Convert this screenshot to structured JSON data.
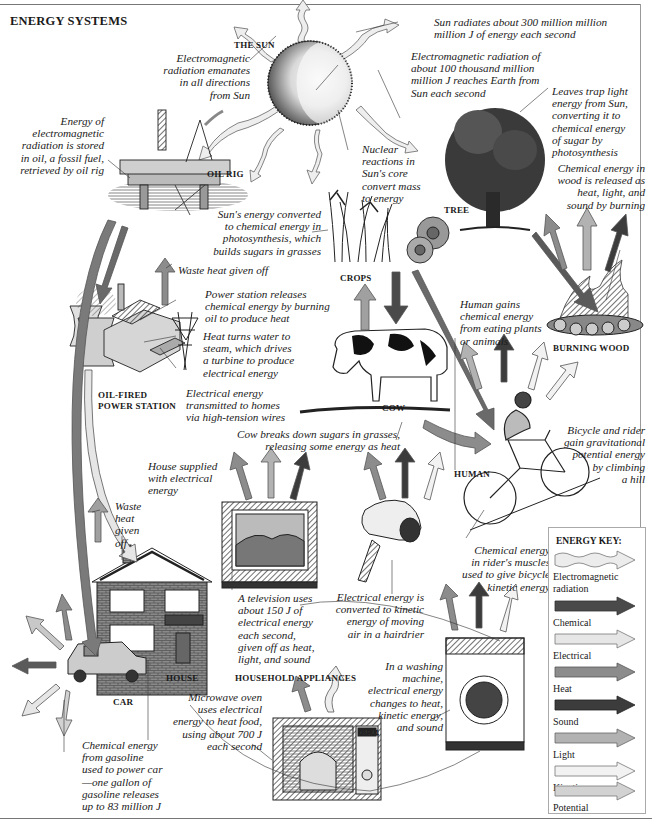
{
  "header": {
    "title": "ENERGY SYSTEMS"
  },
  "labels": {
    "sun": "THE SUN",
    "oil_rig": "OIL RIG",
    "tree": "TREE",
    "crops": "CROPS",
    "burning_wood": "BURNING WOOD",
    "power_station": "OIL-FIRED\nPOWER STATION",
    "power_station_line1": "OIL-FIRED",
    "power_station_line2": "POWER STATION",
    "cow": "COW",
    "human": "HUMAN",
    "house": "HOUSE",
    "household_appliances": "HOUSEHOLD APPLIANCES",
    "car": "CAR"
  },
  "annotations": {
    "em_emanates": "Electromagnetic\nradiation emanates\nin all directions\nfrom Sun",
    "sun_radiates": "Sun radiates about 300 million million\nmillion J of energy each second",
    "em_reaches_earth": "Electromagnetic radiation of\nabout 100 thousand million\nmillion J reaches Earth from\nSun each second",
    "leaves_trap": "Leaves trap light\nenergy from Sun,\nconverting it to\nchemical energy\nof sugar by\nphotosynthesis",
    "oil_stored": "Energy of\nelectromagnetic\nradiation is stored\nin oil, a fossil fuel,\nretrieved by oil rig",
    "nuclear": "Nuclear\nreactions in\nSun's core\nconvert mass\nto energy",
    "wood_released": "Chemical energy in\nwood is released as\nheat, light, and\nsound by burning",
    "photosynthesis_grasses": "Sun's energy converted\nto chemical energy in\nphotosynthesis, which\nbuilds sugars in grasses",
    "waste_heat_station": "Waste heat given off",
    "power_station_releases": "Power station releases\nchemical energy by burning\noil to produce heat",
    "steam_turbine": "Heat turns water to\nsteam, which drives\na turbine to produce\nelectrical energy",
    "transmitted": "Electrical energy\ntransmitted to homes\nvia high-tension wires",
    "human_gains": "Human gains\nchemical energy\nfrom eating plants\nor animals",
    "cow_breaks_down": "Cow breaks down sugars in grasses,\nreleasing some energy as heat",
    "bicycle_potential": "Bicycle and rider\ngain gravitational\npotential energy\nby climbing\na hill",
    "house_supplied": "House supplied\nwith electrical\nenergy",
    "waste_heat_house": "Waste\nheat\ngiven\noff",
    "tv_uses": "A television uses\nabout 150 J of\nelectrical energy\neach second,\ngiven off as heat,\nlight, and sound",
    "hairdrier": "Electrical energy is\nconverted to kinetic\nenergy of moving\nair in a hairdrier",
    "rider_muscles": "Chemical energy\nin rider's muscles\nused to give bicycle\nkinetic energy",
    "washing_machine": "In a washing\nmachine,\nelectrical energy\nchanges to heat,\nkinetic energy,\nand sound",
    "microwave": "Microwave oven\nuses electrical\nenergy to heat food,\nusing about 700 J\neach second",
    "car_gasoline": "Chemical energy\nfrom gasoline\nused to power car\n—one gallon of\ngasoline releases\nup to 83 million J"
  },
  "microwave_display": "12:11",
  "energy_key": {
    "title": "ENERGY KEY:",
    "items": [
      {
        "label": "Electromagnetic\nradiation",
        "line1": "Electromagnetic",
        "line2": "radiation",
        "color": "#ececec",
        "style": "wavy"
      },
      {
        "label": "Chemical",
        "line1": "Chemical",
        "color": "#4a4a4a",
        "style": "solid"
      },
      {
        "label": "Electrical",
        "line1": "Electrical",
        "color": "#e6e6e6",
        "style": "solid"
      },
      {
        "label": "Heat",
        "line1": "Heat",
        "color": "#8c8c8c",
        "style": "solid"
      },
      {
        "label": "Sound",
        "line1": "Sound",
        "color": "#3c3c3c",
        "style": "solid"
      },
      {
        "label": "Light",
        "line1": "Light",
        "color": "#b2b2b2",
        "style": "solid"
      },
      {
        "label": "Kinetic",
        "line1": "Kinetic",
        "color": "#f2f2f2",
        "style": "solid"
      },
      {
        "label": "Potential",
        "line1": "Potential",
        "color": "#d2d2d2",
        "style": "solid"
      }
    ]
  },
  "colors": {
    "em": "#ececec",
    "chemical": "#4a4a4a",
    "electrical": "#e6e6e6",
    "heat": "#8c8c8c",
    "sound": "#3c3c3c",
    "light": "#b2b2b2",
    "kinetic": "#f2f2f2",
    "potential": "#d2d2d2",
    "outline": "#555555"
  }
}
